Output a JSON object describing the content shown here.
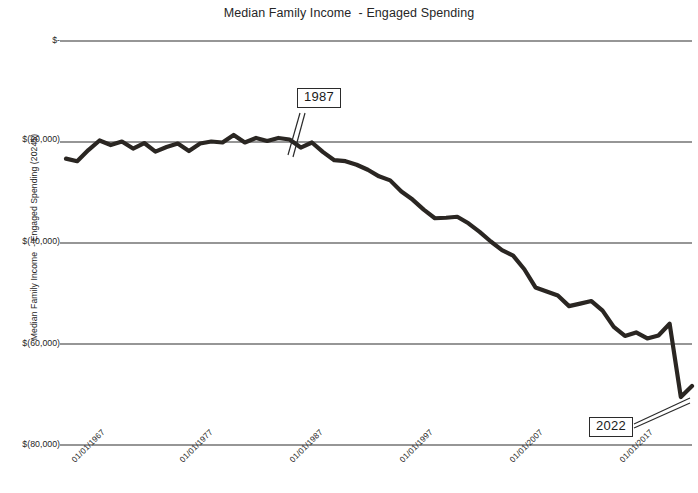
{
  "chart_data": {
    "type": "line",
    "title": "Median Family Income  - Engaged Spending",
    "xlabel": "",
    "ylabel": "Median Family Income  - Engaged Spending (2024$)",
    "ylim": [
      -80000,
      0
    ],
    "y_ticks": [
      0,
      -20000,
      -40000,
      -60000,
      -80000
    ],
    "y_tick_labels": [
      "$-",
      "$(20,000)",
      "$(40,000)",
      "$(60,000)",
      "$(80,000)"
    ],
    "x_tick_labels": [
      "01/01/1967",
      "01/01/1977",
      "01/01/1987",
      "01/01/1997",
      "01/01/2007",
      "01/01/2017"
    ],
    "x_tick_years": [
      1967,
      1977,
      1987,
      1997,
      2007,
      2017
    ],
    "xlim": [
      1967,
      2023
    ],
    "grid": true,
    "legend": false,
    "series": [
      {
        "name": "Median Family Income - Engaged Spending",
        "x": [
          1967,
          1968,
          1969,
          1970,
          1971,
          1972,
          1973,
          1974,
          1975,
          1976,
          1977,
          1978,
          1979,
          1980,
          1981,
          1982,
          1983,
          1984,
          1985,
          1986,
          1987,
          1988,
          1989,
          1990,
          1991,
          1992,
          1993,
          1994,
          1995,
          1996,
          1997,
          1998,
          1999,
          2000,
          2001,
          2002,
          2003,
          2004,
          2005,
          2006,
          2007,
          2008,
          2009,
          2010,
          2011,
          2012,
          2013,
          2014,
          2015,
          2016,
          2017,
          2018,
          2019,
          2020,
          2021,
          2022,
          2023
        ],
        "values": [
          -23300,
          -23800,
          -21600,
          -19700,
          -20600,
          -19900,
          -21300,
          -20200,
          -21900,
          -21000,
          -20300,
          -21800,
          -20300,
          -19900,
          -20100,
          -18600,
          -20100,
          -19200,
          -19800,
          -19200,
          -19500,
          -21100,
          -20100,
          -22000,
          -23600,
          -23800,
          -24500,
          -25500,
          -26800,
          -27600,
          -29800,
          -31400,
          -33400,
          -35100,
          -35000,
          -34800,
          -36100,
          -37800,
          -39700,
          -41400,
          -42500,
          -45200,
          -48800,
          -49600,
          -50400,
          -52500,
          -52000,
          -51500,
          -53400,
          -56600,
          -58400,
          -57700,
          -58900,
          -58300,
          -56000,
          -70500,
          -68300
        ]
      }
    ],
    "annotations": [
      {
        "label": "1987",
        "x": 1987,
        "note": "callout pointing to 1987 data point"
      },
      {
        "label": "2022",
        "x": 2022,
        "note": "callout pointing to 2022 data point"
      }
    ]
  },
  "axis": {
    "y_label_0": "$-",
    "y_label_1": "$(20,000)",
    "y_label_2": "$(40,000)",
    "y_label_3": "$(60,000)",
    "y_label_4": "$(80,000)",
    "x_label_0": "01/01/1967",
    "x_label_1": "01/01/1977",
    "x_label_2": "01/01/1987",
    "x_label_3": "01/01/1997",
    "x_label_4": "01/01/2007",
    "x_label_5": "01/01/2017"
  },
  "callouts": {
    "first": "1987",
    "second": "2022"
  }
}
